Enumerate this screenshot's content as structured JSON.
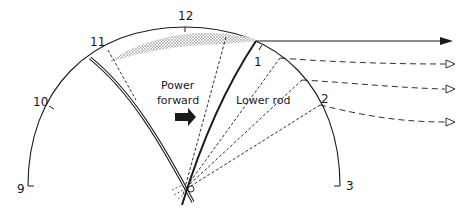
{
  "diagram": {
    "type": "fly-casting clock-face diagram",
    "clock_labels": {
      "nine": "9",
      "ten": "10",
      "eleven": "11",
      "twelve": "12",
      "one": "1",
      "two": "2",
      "three": "3"
    },
    "annotations": {
      "power_forward_line1": "Power",
      "power_forward_line2": "forward",
      "lower_rod": "Lower rod"
    },
    "elements": [
      "clock-arc",
      "rod-start-position (double line, back at 11)",
      "rod-power-position (solid, at 1)",
      "dashed lower-rod positions toward 1-2",
      "stippled loop area between 11 and 1",
      "solid line cast arrow",
      "three dashed line-path arrows"
    ],
    "colors": {
      "ink": "#1a1a1a",
      "stipple": "#9a9a9a",
      "background": "#ffffff"
    }
  }
}
